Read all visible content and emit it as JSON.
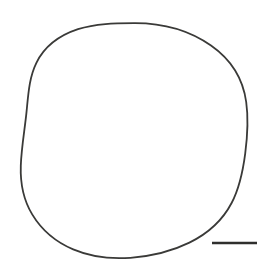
{
  "figure": {
    "domain": "scientific-illustration",
    "kind": "specimen-outline-drawing",
    "title": "",
    "caption": "",
    "background_color": "#ffffff",
    "width": 268,
    "height": 266
  },
  "outline": {
    "name": "specimen-outline",
    "description": "single closed hand-traced near-circular contour",
    "stroke_color": "#3a3a38",
    "stroke_width": 1.8,
    "fill": "none",
    "closed": true,
    "center_x": 134.5,
    "center_y": 140.5,
    "radius_x": 112.5,
    "radius_y": 117.5,
    "bounds": {
      "left": 22,
      "top": 23,
      "right": 247,
      "bottom": 258
    },
    "path": "M 134.0 23.2 C 162.0 23.0 189.5 30.6 211.0 45.6 C 230.6 59.3 243.0 79.0 246.2 102.0 C 248.6 119.0 247.4 136.6 245.2 153.6 C 243.0 170.6 239.6 187.8 231.6 203.0 C 222.6 220.2 207.4 233.8 189.4 242.6 C 171.2 251.6 150.6 256.2 130.4 257.8 C 111.0 259.2 91.0 257.0 73.2 249.4 C 56.2 242.2 41.6 230.0 32.2 214.4 C 23.4 199.8 20.2 182.6 20.8 165.6 C 21.4 148.0 24.6 130.6 26.4 113.2 C 28.2 96.0 28.8 78.2 36.4 62.8 C 44.6 46.2 60.4 35.0 78.0 29.2 C 95.8 23.4 114.8 23.3 134.0 23.2 Z"
  },
  "scalebar": {
    "name": "scale-bar",
    "label": "",
    "color": "#2f2f2d",
    "x1": 212,
    "x2": 257,
    "y": 243,
    "length_px": 45,
    "thickness": 2.4
  }
}
